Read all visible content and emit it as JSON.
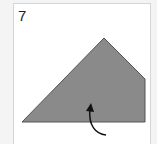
{
  "diagram": {
    "step_number": "7",
    "shape": {
      "type": "polygon",
      "points": [
        [
          22,
          122
        ],
        [
          104,
          38
        ],
        [
          145,
          79
        ],
        [
          145,
          122
        ]
      ],
      "fill": "#8a8a8a",
      "stroke": "#555555"
    },
    "arrow": {
      "type": "curved-arrow",
      "description": "curved arrow pointing up into the shape",
      "color": "#111111"
    }
  }
}
